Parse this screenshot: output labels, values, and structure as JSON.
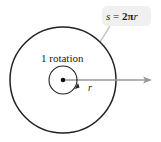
{
  "diagram": {
    "type": "circle-rotation",
    "formula_label": {
      "s": "s",
      "equals": " = ",
      "two_pi": "2π",
      "r": "r"
    },
    "rotation_label": "1 rotation",
    "radius_label": "r",
    "colors": {
      "circle_stroke": "#222222",
      "arrow": "#9a9a9a",
      "label_box": "#f0f0f0",
      "leader_line": "#c8c8c8"
    }
  }
}
